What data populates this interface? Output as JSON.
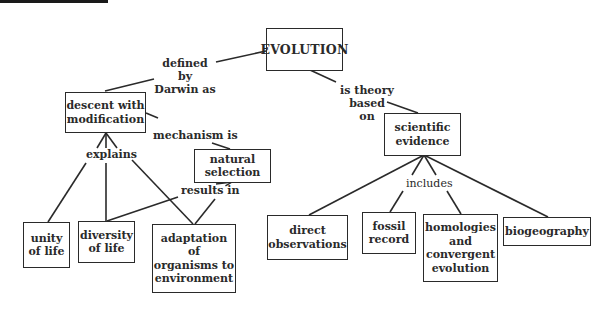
{
  "diagram": {
    "type": "concept-map",
    "title": "EVOLUTION",
    "colors": {
      "ink": "#2a2a2a",
      "background": "#ffffff",
      "top_bar": "#1a1a1a"
    },
    "nodes": {
      "evolution": "EVOLUTION",
      "descent": "descent with\nmodification",
      "natural_selection": "natural\nselection",
      "scientific_evidence": "scientific\nevidence",
      "unity": "unity\nof life",
      "diversity": "diversity\nof life",
      "adaptation": "adaptation of\norganisms to\nenvironment",
      "direct_observations": "direct\nobservations",
      "fossil_record": "fossil\nrecord",
      "homologies": "homologies\nand\nconvergent\nevolution",
      "biogeography": "biogeography"
    },
    "links": {
      "defined_by": "defined by\nDarwin as",
      "theory_based": "is theory based\non",
      "mechanism": "mechanism is",
      "explains": "explains",
      "results_in": "results in",
      "includes": "includes"
    },
    "edges": [
      {
        "from": "EVOLUTION",
        "label": "defined by Darwin as",
        "to": "descent with modification"
      },
      {
        "from": "EVOLUTION",
        "label": "is theory based on",
        "to": "scientific evidence"
      },
      {
        "from": "descent with modification",
        "label": "mechanism is",
        "to": "natural selection"
      },
      {
        "from": "descent with modification",
        "label": "explains",
        "to": [
          "unity of life",
          "diversity of life",
          "adaptation of organisms to environment"
        ]
      },
      {
        "from": [
          "diversity of life",
          "adaptation of organisms to environment"
        ],
        "label": "results in",
        "to": "natural selection"
      },
      {
        "from": "scientific evidence",
        "label": "includes",
        "to": [
          "direct observations",
          "fossil record",
          "homologies and convergent evolution",
          "biogeography"
        ]
      }
    ]
  }
}
